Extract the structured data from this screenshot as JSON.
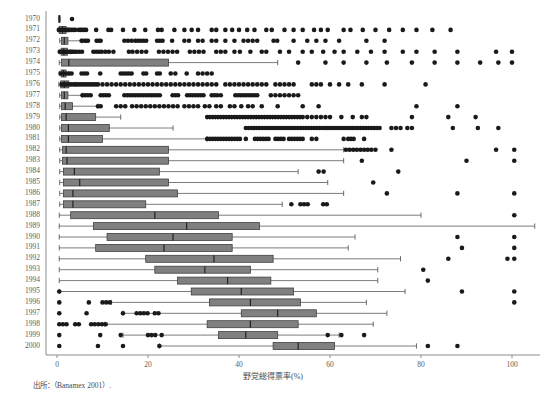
{
  "figure": {
    "title_faint": "",
    "source_note": "出所：（Banamex 2001）.",
    "background": "#ffffff"
  },
  "axes": {
    "x": {
      "label": "野党総得票率(%)",
      "ticks": [
        0,
        20,
        40,
        60,
        80,
        100
      ],
      "tick_labels": [
        "0",
        "20",
        "40",
        "60",
        "80",
        "100"
      ],
      "min": 0,
      "max": 105,
      "px_min": 57,
      "px_max": 512
    },
    "y": {
      "label": "",
      "categories": [
        "1970",
        "1971",
        "1972",
        "1973",
        "1974",
        "1975",
        "1976",
        "1977",
        "1978",
        "1979",
        "1980",
        "1981",
        "1982",
        "1983",
        "1984",
        "1985",
        "1986",
        "1987",
        "1988",
        "1989",
        "1990",
        "1991",
        "1992",
        "1993",
        "1994",
        "1995",
        "1996",
        "1997",
        "1998",
        "1999",
        "2000"
      ],
      "top_px": 19,
      "row_step_px": 10.9
    },
    "frame": {
      "left_px": 46,
      "top_px": 11,
      "bottom_px": 355,
      "right_px": 540,
      "color": "#8c8c8c"
    }
  },
  "style": {
    "box_fill": "#808080",
    "box_stroke": "#404040",
    "median_color": "#1a1a1a",
    "whisker_color": "#5a5a5a",
    "outlier_color": "#1a1a1a",
    "outlier_radius": 2.3,
    "box_height": 7
  },
  "chart_data": {
    "type": "boxplot",
    "title": "",
    "xlabel": "野党総得票率(%)",
    "ylabel": "",
    "xlim": [
      0,
      105
    ],
    "grid": false,
    "legend": "none",
    "orientation": "horizontal",
    "categories": [
      "1970",
      "1971",
      "1972",
      "1973",
      "1974",
      "1975",
      "1976",
      "1977",
      "1978",
      "1979",
      "1980",
      "1981",
      "1982",
      "1983",
      "1984",
      "1985",
      "1986",
      "1987",
      "1988",
      "1989",
      "1990",
      "1991",
      "1992",
      "1993",
      "1994",
      "1995",
      "1996",
      "1997",
      "1998",
      "1999",
      "2000"
    ],
    "boxes": [
      {
        "year": "1970",
        "low": 0.4,
        "q1": 0.4,
        "med": 0.5,
        "q3": 0.6,
        "high": 0.7,
        "outliers": [
          3.3
        ]
      },
      {
        "year": "1971",
        "low": 0.3,
        "q1": 0.5,
        "med": 1.2,
        "q3": 2.0,
        "high": 2.4,
        "outliers": [
          0.4,
          0.8,
          1.2,
          1.6,
          2.0,
          2.4,
          2.8,
          3.2,
          3.6,
          4.0,
          4.8,
          5.2,
          5.6,
          6.0,
          6.4,
          8.6,
          11.3,
          11.9,
          14.5,
          17.0,
          19.4,
          22.2,
          23.0,
          25.8,
          28.0,
          29.6,
          31.0,
          34.0,
          35.0,
          37.0,
          38.5,
          40.0,
          41.8,
          43.4,
          46.0,
          47.2,
          50.0,
          52.0,
          54.0,
          56.5,
          58.0,
          59.5,
          63.0,
          64.5,
          67.2,
          70.0,
          73.0,
          76.0,
          79.0,
          82.5,
          86.5
        ]
      },
      {
        "year": "1972",
        "low": 0.6,
        "q1": 1.0,
        "med": 1.6,
        "q3": 2.4,
        "high": 5.5,
        "outliers": [
          5.4,
          6.0,
          6.4,
          6.8,
          8.7,
          9.2,
          9.6,
          14.8,
          15.6,
          16.4,
          17.2,
          17.8,
          18.4,
          19.0,
          19.6,
          22.0,
          22.6,
          23.2,
          25.3,
          28.0,
          29.0,
          31.0,
          32.0,
          34.0,
          35.0,
          37.0,
          39.0,
          41.0,
          42.0,
          43.0,
          44.0,
          47.6,
          48.4,
          52.0,
          55.0,
          57.0,
          59.0,
          62.0,
          68.0,
          72.0
        ]
      },
      {
        "year": "1973",
        "low": 0.5,
        "q1": 0.9,
        "med": 1.5,
        "q3": 2.3,
        "high": 3.0,
        "outliers": [
          0.6,
          1.0,
          1.4,
          1.8,
          2.2,
          2.6,
          3.0,
          3.4,
          3.8,
          4.3,
          4.9,
          5.5,
          8.0,
          8.6,
          9.2,
          9.8,
          10.6,
          11.4,
          12.4,
          15.8,
          16.6,
          17.6,
          18.6,
          19.6,
          22.4,
          23.4,
          24.4,
          25.4,
          26.4,
          29.2,
          30.2,
          31.2,
          32.2,
          35.0,
          36.0,
          37.0,
          39.0,
          40.2,
          42.5,
          45.0,
          46.0,
          49.0,
          51.0,
          54.0,
          56.0,
          58.5,
          61.0,
          63.0,
          66.0,
          69.0,
          72.0,
          76.0,
          79.0,
          83.0,
          88.0,
          96.5,
          100.0
        ]
      },
      {
        "year": "1974",
        "low": 0.5,
        "q1": 1.0,
        "med": 2.6,
        "q3": 24.5,
        "high": 48.5,
        "outliers": [
          53.0,
          59.0,
          63.0,
          68.0,
          72.5,
          78.0,
          83.0,
          88.0,
          93.0,
          97.0,
          100.0
        ]
      },
      {
        "year": "1975",
        "low": 0.5,
        "q1": 0.9,
        "med": 1.4,
        "q3": 2.0,
        "high": 2.6,
        "outliers": [
          0.8,
          1.4,
          2.0,
          2.6,
          3.2,
          5.4,
          6.0,
          6.6,
          9.5,
          14.0,
          14.6,
          15.2,
          15.8,
          16.4,
          19.0,
          19.6,
          22.0,
          22.6,
          25.0,
          26.0,
          28.5,
          31.0,
          32.0,
          33.0,
          34.0
        ]
      },
      {
        "year": "1976",
        "low": 0.4,
        "q1": 0.8,
        "med": 1.6,
        "q3": 2.6,
        "high": 4.0,
        "outliers": [
          1.0,
          1.5,
          2.0,
          2.5,
          3.0,
          3.5,
          4.0,
          4.5,
          5.0,
          5.5,
          6.0,
          6.5,
          7.0,
          7.5,
          8.0,
          8.5,
          9.0,
          10.0,
          11.0,
          12.0,
          13.0,
          14.0,
          15.0,
          16.0,
          17.0,
          18.0,
          19.0,
          20.0,
          21.0,
          22.0,
          23.0,
          24.0,
          25.0,
          26.0,
          27.0,
          28.0,
          29.0,
          30.0,
          31.0,
          32.0,
          33.0,
          34.0,
          35.0,
          37.0,
          38.0,
          39.0,
          40.0,
          41.0,
          42.0,
          43.0,
          44.0,
          45.0,
          46.0,
          48.0,
          49.0,
          50.0,
          51.0,
          52.0,
          56.0,
          57.0,
          58.0,
          60.0,
          62.0,
          64.0,
          67.0,
          72.0,
          81.0
        ]
      },
      {
        "year": "1977",
        "low": 0.6,
        "q1": 1.0,
        "med": 1.6,
        "q3": 2.4,
        "high": 5.6,
        "outliers": [
          5.6,
          6.2,
          6.8,
          7.4,
          9.6,
          10.2,
          10.8,
          11.4,
          14.8,
          15.4,
          16.0,
          16.6,
          17.2,
          17.8,
          18.4,
          19.0,
          19.6,
          20.2,
          20.8,
          21.4,
          22.0,
          22.6,
          25.4,
          26.0,
          26.6,
          28.6,
          29.2,
          29.8,
          30.4,
          31.0,
          31.6,
          32.2,
          34.0,
          34.6,
          35.2,
          36.0,
          39.2,
          39.8,
          40.4,
          41.0,
          41.6,
          42.2,
          42.8,
          43.4,
          44.0,
          47.0,
          48.0,
          49.0,
          50.0,
          51.0,
          52.0,
          53.0
        ]
      },
      {
        "year": "1978",
        "low": 0.6,
        "q1": 1.0,
        "med": 1.8,
        "q3": 3.4,
        "high": 9.0,
        "outliers": [
          9.0,
          9.6,
          13.0,
          14.0,
          15.0,
          16.5,
          17.5,
          18.5,
          19.5,
          20.5,
          21.5,
          22.5,
          23.5,
          24.5,
          25.5,
          26.5,
          28.0,
          29.0,
          30.0,
          31.0,
          32.5,
          33.5,
          35.0,
          36.0,
          38.0,
          39.0,
          40.5,
          42.0,
          43.0,
          45.0,
          48.5,
          54.0,
          57.5,
          79.0,
          88.0
        ]
      },
      {
        "year": "1979",
        "low": 0.6,
        "q1": 1.0,
        "med": 2.0,
        "q3": 8.5,
        "high": 14.0,
        "outliers": [
          33.0,
          33.6,
          34.2,
          34.8,
          35.4,
          36.0,
          36.6,
          37.2,
          37.8,
          38.4,
          39.0,
          39.6,
          40.2,
          40.8,
          41.4,
          42.0,
          42.6,
          43.2,
          43.8,
          44.4,
          45.0,
          45.6,
          46.2,
          46.8,
          47.4,
          48.0,
          48.6,
          49.2,
          49.8,
          50.4,
          51.0,
          51.6,
          52.2,
          52.8,
          53.4,
          54.0,
          55.0,
          56.0,
          57.0,
          58.0,
          59.0,
          60.0,
          62.5,
          65.0,
          67.0,
          68.0,
          78.0,
          86.0,
          92.0
        ]
      },
      {
        "year": "1980",
        "low": 0.6,
        "q1": 1.0,
        "med": 2.5,
        "q3": 11.5,
        "high": 25.5,
        "outliers": [
          41.5,
          42.1,
          42.7,
          43.3,
          43.9,
          44.5,
          45.1,
          45.7,
          46.3,
          46.9,
          47.5,
          48.1,
          48.7,
          49.3,
          49.9,
          50.5,
          51.1,
          51.7,
          52.3,
          52.9,
          53.5,
          54.1,
          54.7,
          55.3,
          55.9,
          56.5,
          57.1,
          57.7,
          58.3,
          58.9,
          59.5,
          60.1,
          60.7,
          61.3,
          61.9,
          62.5,
          63.1,
          63.7,
          64.3,
          64.9,
          65.5,
          66.1,
          66.7,
          67.3,
          67.9,
          68.5,
          69.1,
          69.7,
          70.3,
          70.9,
          73.5,
          74.5,
          75.5,
          77.0,
          78.0,
          87.0,
          92.5,
          97.0
        ]
      },
      {
        "year": "1981",
        "low": 0.6,
        "q1": 1.0,
        "med": 2.5,
        "q3": 10.0,
        "high": 33.0,
        "outliers": [
          33.0,
          33.6,
          34.2,
          34.8,
          35.4,
          36.0,
          36.6,
          37.2,
          37.8,
          38.4,
          39.0,
          39.6,
          40.2,
          41.5,
          43.5,
          44.1,
          44.7,
          45.3,
          45.9,
          46.5,
          48.0,
          48.6,
          49.2,
          49.8,
          51.0,
          51.6,
          52.2,
          52.8,
          53.4,
          54.0,
          56.0,
          57.0,
          63.0,
          64.0,
          64.6,
          65.2,
          67.5
        ]
      },
      {
        "year": "1982",
        "low": 0.6,
        "q1": 1.2,
        "med": 2.0,
        "q3": 24.5,
        "high": 63.0,
        "outliers": [
          63.5,
          64.3,
          65.1,
          65.9,
          66.7,
          67.5,
          68.3,
          69.1,
          70.0,
          73.5,
          96.5,
          100.5
        ]
      },
      {
        "year": "1983",
        "low": 0.6,
        "q1": 1.2,
        "med": 2.2,
        "q3": 24.5,
        "high": 63.0,
        "outliers": [
          67.0,
          90.0,
          100.5
        ]
      },
      {
        "year": "1984",
        "low": 0.6,
        "q1": 1.4,
        "med": 3.8,
        "q3": 22.5,
        "high": 53.0,
        "outliers": [
          57.5,
          58.6,
          75.0
        ]
      },
      {
        "year": "1985",
        "low": 0.6,
        "q1": 1.4,
        "med": 5.0,
        "q3": 24.5,
        "high": 59.5,
        "outliers": [
          69.5
        ]
      },
      {
        "year": "1986",
        "low": 0.6,
        "q1": 1.4,
        "med": 3.5,
        "q3": 26.5,
        "high": 63.0,
        "outliers": [
          72.5,
          88.0,
          100.5
        ]
      },
      {
        "year": "1987",
        "low": 0.6,
        "q1": 1.4,
        "med": 3.5,
        "q3": 19.5,
        "high": 49.5,
        "outliers": [
          51.5,
          53.5,
          54.3,
          55.1,
          58.5,
          59.3
        ]
      },
      {
        "year": "1988",
        "low": 0.5,
        "q1": 3.0,
        "med": 21.5,
        "high": 80.0,
        "q3": 35.5,
        "outliers": [
          100.5
        ]
      },
      {
        "year": "1989",
        "low": 0.5,
        "q1": 8.0,
        "med": 28.5,
        "q3": 44.5,
        "high": 105.0,
        "outliers": []
      },
      {
        "year": "1990",
        "low": 0.5,
        "q1": 11.0,
        "med": 25.5,
        "q3": 38.5,
        "high": 65.5,
        "outliers": [
          88.0,
          100.5
        ]
      },
      {
        "year": "1991",
        "low": 0.5,
        "q1": 8.5,
        "med": 23.5,
        "q3": 38.5,
        "high": 64.0,
        "outliers": [
          89.0,
          100.5
        ]
      },
      {
        "year": "1992",
        "low": 0.5,
        "q1": 19.5,
        "med": 34.5,
        "q3": 47.5,
        "high": 75.5,
        "outliers": [
          86.0,
          99.0,
          100.5
        ]
      },
      {
        "year": "1993",
        "low": 0.5,
        "q1": 21.5,
        "med": 32.5,
        "q3": 42.5,
        "high": 70.5,
        "outliers": [
          80.5
        ]
      },
      {
        "year": "1994",
        "low": 0.5,
        "q1": 26.5,
        "med": 37.5,
        "q3": 47.0,
        "high": 70.5,
        "outliers": [
          81.5
        ]
      },
      {
        "year": "1995",
        "low": 0.5,
        "q1": 29.5,
        "med": 40.5,
        "q3": 52.0,
        "high": 76.5,
        "outliers": [
          0.5,
          89.0,
          100.5
        ]
      },
      {
        "year": "1996",
        "low": 12.0,
        "q1": 33.5,
        "med": 42.5,
        "q3": 53.5,
        "high": 68.0,
        "outliers": [
          0.5,
          7.0,
          10.0,
          10.8,
          11.6,
          100.5
        ]
      },
      {
        "year": "1997",
        "low": 14.5,
        "q1": 40.5,
        "med": 48.5,
        "q3": 57.0,
        "high": 72.5,
        "outliers": [
          0.5,
          6.5,
          14.5,
          17.5,
          18.3,
          19.1,
          19.9,
          21.5,
          22.3
        ]
      },
      {
        "year": "1998",
        "low": 10.5,
        "q1": 33.0,
        "med": 42.5,
        "q3": 53.0,
        "high": 69.5,
        "outliers": [
          0.5,
          1.3,
          2.1,
          4.0,
          4.8,
          7.5,
          8.3,
          9.1,
          9.9,
          10.7
        ]
      },
      {
        "year": "1999",
        "low": 14.5,
        "q1": 35.5,
        "med": 41.5,
        "q3": 48.5,
        "high": 62.0,
        "outliers": [
          0.5,
          9.5,
          14.0,
          20.0,
          20.8,
          21.6,
          23.0,
          59.5,
          62.5,
          67.5
        ]
      },
      {
        "year": "2000",
        "low": 22.5,
        "q1": 47.5,
        "med": 53.0,
        "q3": 61.0,
        "high": 79.0,
        "outliers": [
          0.5,
          9.0,
          14.5,
          22.5,
          81.5,
          88.0
        ]
      }
    ]
  }
}
